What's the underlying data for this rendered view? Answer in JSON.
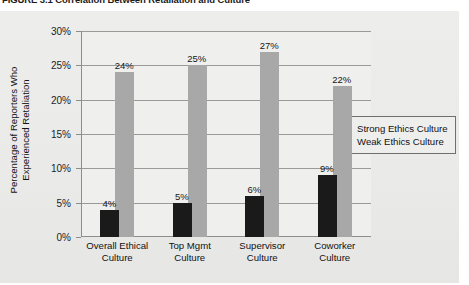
{
  "figure": {
    "caption": "FIGURE 3.1  Correlation Between Retaliation and Culture"
  },
  "legend": {
    "items": [
      {
        "label": "Strong Ethics Culture",
        "color": "#1a1a1a",
        "key": "strong"
      },
      {
        "label": "Weak Ethics Culture",
        "color": "#b3b3b3",
        "key": "weak"
      }
    ]
  },
  "axis": {
    "y_title_line1": "Percentage of Reporters Who",
    "y_title_line2": "Experienced Retaliation",
    "y_ticks": [
      "0%",
      "5%",
      "10%",
      "15%",
      "20%",
      "25%",
      "30%"
    ]
  },
  "chart_data": {
    "type": "bar",
    "title": "FIGURE 3.1  Correlation Between Retaliation and Culture",
    "xlabel": "",
    "ylabel": "Percentage of Reporters Who Experienced Retaliation",
    "ylim": [
      0,
      30
    ],
    "ytick_step": 5,
    "grid": true,
    "legend_position": "right",
    "value_suffix": "%",
    "categories": [
      "Overall Ethical Culture",
      "Top Mgmt Culture",
      "Supervisor Culture",
      "Coworker Culture"
    ],
    "category_lines": [
      [
        "Overall Ethical",
        "Culture"
      ],
      [
        "Top Mgmt",
        "Culture"
      ],
      [
        "Supervisor",
        "Culture"
      ],
      [
        "Coworker",
        "Culture"
      ]
    ],
    "series": [
      {
        "name": "Strong Ethics Culture",
        "color": "#1a1a1a",
        "values": [
          4,
          5,
          6,
          9
        ],
        "labels": [
          "4%",
          "5%",
          "6%",
          "9%"
        ]
      },
      {
        "name": "Weak Ethics Culture",
        "color": "#a8a8a8",
        "values": [
          24,
          25,
          27,
          22
        ],
        "labels": [
          "24%",
          "25%",
          "27%",
          "22%"
        ]
      }
    ]
  }
}
